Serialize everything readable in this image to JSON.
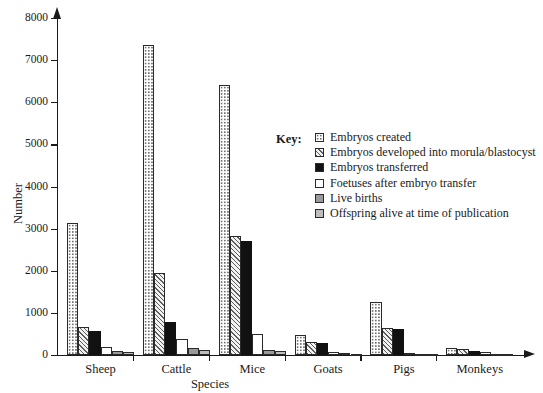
{
  "chart_data": {
    "type": "bar",
    "title": "",
    "xlabel": "Species",
    "ylabel": "Number",
    "ylim": [
      0,
      8000
    ],
    "yticks": [
      0,
      1000,
      2000,
      3000,
      4000,
      5000,
      6000,
      7000,
      8000
    ],
    "ytick_labels": [
      "0",
      "1000",
      "2000",
      "3000",
      "4000",
      "5000",
      "6000",
      "7000",
      "8000"
    ],
    "grid": false,
    "legend_position": "inside-right",
    "legend_title": "Key:",
    "categories": [
      "Sheep",
      "Cattle",
      "Mice",
      "Goats",
      "Pigs",
      "Monkeys"
    ],
    "series": [
      {
        "name": "Embryos created",
        "pattern": "dots",
        "values": [
          3130,
          7350,
          6420,
          480,
          1250,
          170
        ]
      },
      {
        "name": "Embryos developed into morula/blastocyst",
        "pattern": "diagonal-hatch",
        "values": [
          660,
          1950,
          2820,
          310,
          650,
          140
        ]
      },
      {
        "name": "Embryos transferred",
        "pattern": "solid-black",
        "values": [
          570,
          780,
          2700,
          290,
          610,
          100
        ]
      },
      {
        "name": "Foetuses after embryo transfer",
        "pattern": "white",
        "values": [
          180,
          370,
          500,
          60,
          40,
          60
        ]
      },
      {
        "name": "Live births",
        "pattern": "mid-gray",
        "values": [
          90,
          160,
          130,
          40,
          25,
          30
        ]
      },
      {
        "name": "Offspring alive at time of publication",
        "pattern": "light-gray",
        "values": [
          60,
          110,
          90,
          30,
          20,
          20
        ]
      }
    ]
  }
}
